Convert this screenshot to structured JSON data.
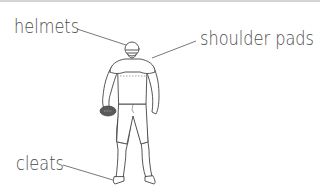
{
  "diagram": {
    "labels": [
      {
        "id": "helmets",
        "text": "helmets"
      },
      {
        "id": "shoulder_pads",
        "text": "shoulder pads"
      },
      {
        "id": "cleats",
        "text": "cleats"
      }
    ]
  },
  "colors": {
    "text": "#4a4a4a",
    "line": "#555555",
    "football": "#5a5a5a",
    "border": "#d4d4d4"
  }
}
